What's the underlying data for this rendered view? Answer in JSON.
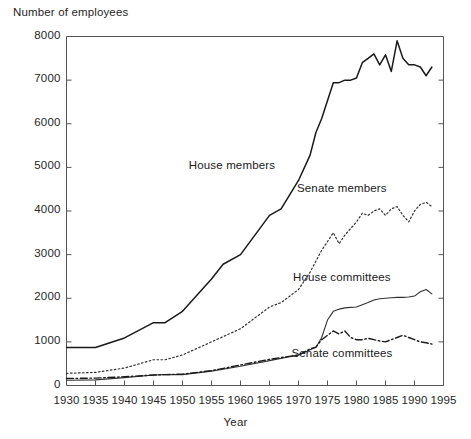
{
  "chart_data": {
    "type": "line",
    "title": "",
    "ylabel": "Number of employees",
    "xlabel": "Year",
    "xlim": [
      1930,
      1995
    ],
    "ylim": [
      0,
      8000
    ],
    "grid": false,
    "legend_position": "inline-annotations",
    "y_ticks": [
      0,
      1000,
      2000,
      3000,
      4000,
      5000,
      6000,
      7000,
      8000
    ],
    "y_tick_labels": [
      "0",
      "1000",
      "2000",
      "3000",
      "4000",
      "5000",
      "6000",
      "7000",
      "8000"
    ],
    "x_ticks": [
      1930,
      1935,
      1940,
      1945,
      1950,
      1955,
      1960,
      1965,
      1970,
      1975,
      1980,
      1985,
      1990,
      1995
    ],
    "x_tick_labels": [
      "1930",
      "1935",
      "1940",
      "1945",
      "1950",
      "1955",
      "1960",
      "1965",
      "1970",
      "1975",
      "1980",
      "1985",
      "1990",
      "1995"
    ],
    "series": [
      {
        "name": "House members",
        "label": "House members",
        "style": "solid",
        "color": "#1a1a1a",
        "label_x": 1958.5,
        "label_y": 5000,
        "x": [
          1930,
          1935,
          1940,
          1945,
          1947,
          1950,
          1955,
          1957,
          1960,
          1965,
          1967,
          1970,
          1972,
          1973,
          1974,
          1976,
          1977,
          1978,
          1979,
          1980,
          1981,
          1982,
          1983,
          1984,
          1985,
          1986,
          1987,
          1988,
          1989,
          1990,
          1991,
          1992,
          1993
        ],
        "y": [
          870,
          870,
          1090,
          1440,
          1440,
          1700,
          2440,
          2780,
          3000,
          3900,
          4050,
          4700,
          5280,
          5800,
          6120,
          6940,
          6942,
          7000,
          7000,
          7050,
          7400,
          7500,
          7600,
          7350,
          7580,
          7200,
          7900,
          7500,
          7350,
          7350,
          7300,
          7100,
          7300
        ]
      },
      {
        "name": "Senate members",
        "label": "Senate members",
        "style": "dotted",
        "color": "#333333",
        "label_x": 1977.5,
        "label_y": 4480,
        "x": [
          1930,
          1935,
          1940,
          1945,
          1947,
          1950,
          1955,
          1960,
          1965,
          1967,
          1970,
          1972,
          1974,
          1975,
          1976,
          1977,
          1978,
          1979,
          1980,
          1981,
          1982,
          1983,
          1984,
          1985,
          1986,
          1987,
          1988,
          1989,
          1990,
          1991,
          1992,
          1993
        ],
        "y": [
          280,
          300,
          400,
          590,
          590,
          700,
          1000,
          1300,
          1800,
          1900,
          2200,
          2600,
          3100,
          3300,
          3500,
          3250,
          3450,
          3600,
          3750,
          3950,
          3900,
          4000,
          4050,
          3900,
          4050,
          4100,
          3900,
          3750,
          4000,
          4150,
          4200,
          4100
        ]
      },
      {
        "name": "House committees",
        "label": "House committees",
        "style": "solid-thin",
        "color": "#333333",
        "label_x": 1977.5,
        "label_y": 2450,
        "x": [
          1930,
          1935,
          1940,
          1945,
          1947,
          1950,
          1955,
          1960,
          1965,
          1970,
          1972,
          1973,
          1974,
          1975,
          1976,
          1977,
          1978,
          1979,
          1980,
          1981,
          1982,
          1983,
          1984,
          1985,
          1986,
          1987,
          1988,
          1989,
          1990,
          1991,
          1992,
          1993
        ],
        "y": [
          120,
          130,
          180,
          240,
          250,
          250,
          330,
          440,
          570,
          700,
          820,
          870,
          1100,
          1500,
          1700,
          1750,
          1780,
          1790,
          1800,
          1850,
          1900,
          1960,
          1990,
          2000,
          2010,
          2020,
          2020,
          2030,
          2050,
          2150,
          2200,
          2100
        ]
      },
      {
        "name": "Senate committees",
        "label": "Senate committees",
        "style": "dash-dot",
        "color": "#1a1a1a",
        "label_x": 1977.5,
        "label_y": 700,
        "x": [
          1930,
          1935,
          1940,
          1945,
          1947,
          1950,
          1955,
          1960,
          1965,
          1970,
          1972,
          1973,
          1974,
          1975,
          1976,
          1977,
          1978,
          1979,
          1980,
          1981,
          1982,
          1983,
          1984,
          1985,
          1986,
          1987,
          1988,
          1989,
          1990,
          1991,
          1992,
          1993
        ],
        "y": [
          160,
          170,
          200,
          240,
          250,
          260,
          340,
          470,
          600,
          700,
          840,
          880,
          1050,
          1150,
          1250,
          1180,
          1250,
          1100,
          1050,
          1050,
          1080,
          1050,
          1020,
          1000,
          1050,
          1100,
          1150,
          1100,
          1050,
          1000,
          980,
          950
        ]
      }
    ]
  }
}
